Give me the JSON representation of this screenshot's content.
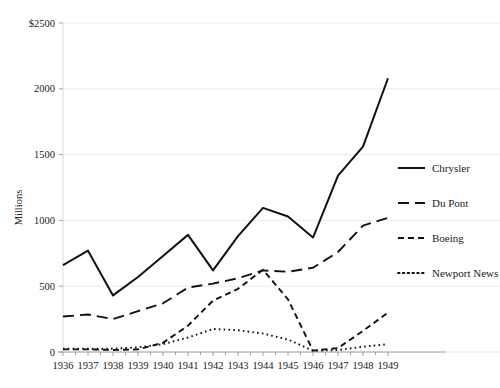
{
  "chart_data": {
    "type": "line",
    "title": "",
    "subtitle": "",
    "xlabel": "",
    "ylabel": "Millions",
    "x": [
      1936,
      1937,
      1938,
      1939,
      1940,
      1941,
      1942,
      1943,
      1944,
      1945,
      1946,
      1947,
      1948,
      1949
    ],
    "xtick_labels": [
      "1936",
      "1937",
      "1938",
      "1939",
      "1940",
      "1941",
      "1942",
      "1943",
      "1944",
      "1945",
      "1946",
      "1947",
      "1948",
      "1949"
    ],
    "ytick_values": [
      0,
      500,
      1000,
      1500,
      2000,
      2500
    ],
    "ytick_labels": [
      "0",
      "500",
      "1000",
      "1500",
      "2000",
      "$2500"
    ],
    "ylim": [
      0,
      2500
    ],
    "xlim": [
      1936,
      1949
    ],
    "grid": "horizontal",
    "legend_position": "right",
    "series": [
      {
        "name": "Chrysler",
        "dash": "solid",
        "color": "#111111",
        "width": 2.0,
        "values": [
          660,
          770,
          430,
          570,
          730,
          890,
          620,
          880,
          1095,
          1030,
          870,
          1340,
          1560,
          2080
        ]
      },
      {
        "name": "Du Pont",
        "dash": "long-dash",
        "color": "#111111",
        "width": 1.9,
        "values": [
          270,
          285,
          250,
          310,
          370,
          490,
          520,
          560,
          620,
          610,
          640,
          760,
          960,
          1020
        ]
      },
      {
        "name": "Boeing",
        "dash": "medium-dash",
        "color": "#111111",
        "width": 1.9,
        "values": [
          20,
          20,
          15,
          20,
          70,
          200,
          390,
          480,
          625,
          400,
          10,
          30,
          160,
          300
        ]
      },
      {
        "name": "Newport News",
        "dash": "dotted",
        "color": "#111111",
        "width": 1.9,
        "values": [
          25,
          25,
          25,
          35,
          60,
          110,
          175,
          165,
          140,
          95,
          10,
          15,
          40,
          60
        ]
      }
    ]
  },
  "legend": {
    "items": [
      {
        "label": "Chrysler"
      },
      {
        "label": "Du Pont"
      },
      {
        "label": "Boeing"
      },
      {
        "label": "Newport News"
      }
    ]
  },
  "axes": {
    "y_title": "Millions"
  }
}
